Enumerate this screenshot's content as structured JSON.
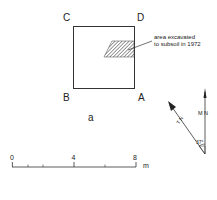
{
  "plan": {
    "corners": {
      "a": "A",
      "b": "B",
      "c": "C",
      "d": "D"
    },
    "figure_label": "a",
    "annotation_line1": "area excavated",
    "annotation_line2": "to subsoil in 1972"
  },
  "north_arrow": {
    "true_north_label": "T N",
    "magnetic_north_label": "M N",
    "angle_label": "37°"
  },
  "scale_bar": {
    "ticks": [
      "0",
      "4",
      "8"
    ],
    "unit": "m"
  },
  "colors": {
    "ink": "#222222",
    "background": "#ffffff"
  }
}
